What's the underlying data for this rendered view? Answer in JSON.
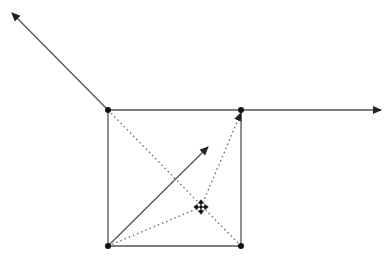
{
  "diagram": {
    "type": "vector-geometry",
    "background": "#ffffff",
    "colors": {
      "line": "#444444",
      "point": "#000000"
    },
    "points": {
      "top_left": [
        108,
        110
      ],
      "top_right": [
        241,
        110
      ],
      "bottom_left": [
        108,
        246
      ],
      "bottom_right": [
        241,
        246
      ],
      "cursor": [
        201,
        207
      ]
    },
    "square_edges": [
      "top_left-top_right",
      "top_right-bottom_right",
      "bottom_right-bottom_left",
      "bottom_left-top_left"
    ],
    "arrows_solid": [
      {
        "from": [
          108,
          110
        ],
        "to": [
          12,
          13
        ]
      },
      {
        "from": [
          241,
          110
        ],
        "to": [
          381,
          110
        ]
      },
      {
        "from": [
          108,
          246
        ],
        "to": [
          208,
          147
        ]
      }
    ],
    "lines_dotted": [
      {
        "from": [
          108,
          110
        ],
        "to": [
          241,
          246
        ]
      },
      {
        "from": [
          108,
          246
        ],
        "to": [
          201,
          207
        ]
      }
    ],
    "arrows_dotted": [
      {
        "from": [
          201,
          207
        ],
        "to": [
          241,
          112
        ]
      }
    ],
    "cursor_icon": "move-cursor-icon"
  }
}
